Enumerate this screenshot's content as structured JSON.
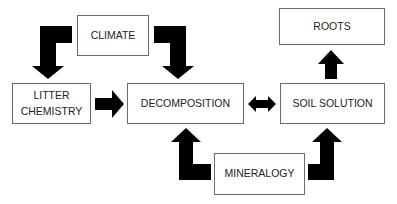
{
  "diagram": {
    "nodes": [
      {
        "id": "climate",
        "label": "CLIMATE"
      },
      {
        "id": "litter",
        "label_line1": "LITTER",
        "label_line2": "CHEMISTRY"
      },
      {
        "id": "decomposition",
        "label": "DECOMPOSITION"
      },
      {
        "id": "soil_solution",
        "label": "SOIL SOLUTION"
      },
      {
        "id": "roots",
        "label": "ROOTS"
      },
      {
        "id": "mineralogy",
        "label": "MINERALOGY"
      }
    ],
    "edges": [
      {
        "from": "climate",
        "to": "litter",
        "type": "elbow"
      },
      {
        "from": "climate",
        "to": "decomposition",
        "type": "elbow"
      },
      {
        "from": "litter",
        "to": "decomposition",
        "type": "straight"
      },
      {
        "from": "decomposition",
        "to": "soil_solution",
        "type": "bidirectional"
      },
      {
        "from": "soil_solution",
        "to": "roots",
        "type": "straight"
      },
      {
        "from": "mineralogy",
        "to": "decomposition",
        "type": "elbow"
      },
      {
        "from": "mineralogy",
        "to": "soil_solution",
        "type": "elbow"
      }
    ],
    "colors": {
      "arrow": "#000000",
      "box_border": "#6a6a6a",
      "text": "#222222"
    }
  }
}
